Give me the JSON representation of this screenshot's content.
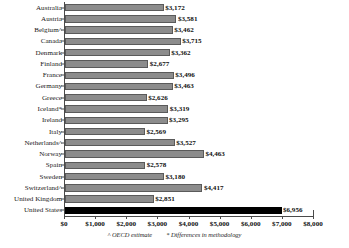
{
  "chart_data": {
    "type": "bar",
    "orientation": "horizontal",
    "title": "",
    "xlabel": "",
    "ylabel": "",
    "xlim": [
      0,
      8000
    ],
    "grid": true,
    "grid_axis": "x",
    "categories": [
      "Australia",
      "Austria",
      "Belgium^",
      "Canada",
      "Denmark",
      "Finland",
      "France",
      "Germany",
      "Greece",
      "Iceland*",
      "Ireland",
      "Italy",
      "Netherlands^",
      "Norway",
      "Spain",
      "Sweden",
      "Switzerland^",
      "United Kingdom",
      "United States"
    ],
    "values": [
      3172,
      3581,
      3462,
      3715,
      3362,
      2677,
      3496,
      3463,
      2626,
      3319,
      3295,
      2569,
      3527,
      4463,
      2578,
      3180,
      4417,
      2851,
      6956
    ],
    "value_labels": [
      "$3,172",
      "$3,581",
      "$3,462",
      "$3,715",
      "$3,362",
      "$2,677",
      "$3,496",
      "$3,463",
      "$2,626",
      "$3,319",
      "$3,295",
      "$2,569",
      "$3,527",
      "$4,463",
      "$2,578",
      "$3,180",
      "$4,417",
      "$2,851",
      "$6,956"
    ],
    "highlight_category": "United States",
    "highlight_color": "#000000",
    "bar_color": "#8c8c8c",
    "xticks": [
      0,
      1000,
      2000,
      3000,
      4000,
      5000,
      6000,
      7000,
      8000
    ],
    "xtick_labels": [
      "$0",
      "$1,000",
      "$2,000",
      "$3,000",
      "$4,000",
      "$5,000",
      "$6,000",
      "$7,000",
      "$8,000"
    ],
    "annotations": [
      "^ OECD estimate",
      "* Differences in methodology"
    ]
  }
}
